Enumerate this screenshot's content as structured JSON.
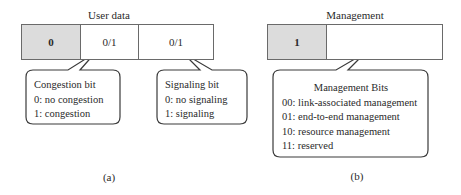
{
  "panel_a": {
    "title": "User data",
    "cells": [
      {
        "value": "0",
        "shaded": true
      },
      {
        "value": "0/1",
        "shaded": false
      },
      {
        "value": "0/1",
        "shaded": false
      }
    ],
    "callouts": [
      {
        "heading": "Congestion bit",
        "lines": [
          "0: no congestion",
          "1: congestion"
        ]
      },
      {
        "heading": "Signaling bit",
        "lines": [
          "0: no signaling",
          "1: signaling"
        ]
      }
    ],
    "caption": "(a)"
  },
  "panel_b": {
    "title": "Management",
    "cells": [
      {
        "value": "1",
        "shaded": true
      },
      {
        "value": "",
        "shaded": false
      }
    ],
    "callout": {
      "heading": "Management Bits",
      "lines": [
        "00: link-associated management",
        "01: end-to-end management",
        "10: resource management",
        "11: reserved"
      ]
    },
    "caption": "(b)"
  },
  "colors": {
    "shaded_cell": "#dcdcdc",
    "stroke": "#3a3a3a",
    "text": "#2a2a2a"
  }
}
